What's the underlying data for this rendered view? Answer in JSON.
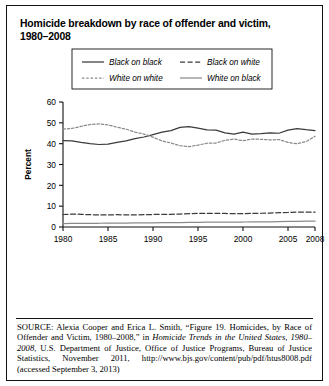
{
  "figure": {
    "title_line1": "Homicide breakdown by race of offender and victim,",
    "title_line2": "1980–2008"
  },
  "source": {
    "label": "SOURCE:",
    "text_part1": " Alexia Cooper and Erica L. Smith, “Figure 19. Homicides, by Race of Offender and Victim, 1980–2008,” in ",
    "italic1": "Homicide Trends in the United States, 1980–2008",
    "text_part2": ", U.S. Department of Justice, Office of Justice Programs, Bureau of Justice Statistics, November 2011, http://www.bjs.gov/content/pub/pdf/htus8008.pdf (accessed September 3, 2013)"
  },
  "chart_data": {
    "type": "line",
    "title": "Homicide breakdown by race of offender and victim, 1980–2008",
    "xlabel": "",
    "ylabel": "Percent",
    "ylim": [
      0,
      60
    ],
    "yticks": [
      0,
      10,
      20,
      30,
      40,
      50,
      60
    ],
    "xlim": [
      1980,
      2008
    ],
    "xticks": [
      1980,
      1985,
      1990,
      1995,
      2000,
      2005,
      2008
    ],
    "xtick_labels": [
      "1980",
      "1985",
      "1990",
      "1995",
      "2000",
      "2005",
      "2008"
    ],
    "grid": false,
    "legend_position": "top-center",
    "x": [
      1980,
      1981,
      1982,
      1983,
      1984,
      1985,
      1986,
      1987,
      1988,
      1989,
      1990,
      1991,
      1992,
      1993,
      1994,
      1995,
      1996,
      1997,
      1998,
      1999,
      2000,
      2001,
      2002,
      2003,
      2004,
      2005,
      2006,
      2007,
      2008
    ],
    "series": [
      {
        "name": "Black on black",
        "style": "solid",
        "color": "#3b3b3b",
        "values": [
          41.5,
          41.3,
          40.6,
          40.0,
          39.6,
          39.8,
          40.6,
          41.3,
          42.4,
          43.2,
          44.3,
          45.5,
          46.3,
          47.8,
          48.2,
          47.5,
          46.6,
          46.5,
          45.2,
          44.6,
          45.5,
          44.6,
          44.8,
          45.2,
          45.0,
          46.5,
          47.2,
          46.7,
          46.3
        ]
      },
      {
        "name": "Black on white",
        "style": "dashed",
        "color": "#3b3b3b",
        "values": [
          6.0,
          6.2,
          6.1,
          5.9,
          5.8,
          5.8,
          5.9,
          5.8,
          5.8,
          5.9,
          6.0,
          6.1,
          6.1,
          6.2,
          6.4,
          6.5,
          6.5,
          6.6,
          6.5,
          6.4,
          6.4,
          6.5,
          6.6,
          6.7,
          6.9,
          7.0,
          7.2,
          7.2,
          7.1
        ]
      },
      {
        "name": "White on white",
        "style": "fine-dashed",
        "color": "#8a8a8a",
        "values": [
          47.0,
          47.3,
          48.3,
          49.2,
          49.5,
          49.0,
          47.9,
          47.0,
          45.5,
          44.6,
          43.1,
          41.3,
          40.3,
          39.0,
          38.6,
          39.3,
          40.2,
          40.3,
          41.6,
          42.2,
          41.4,
          42.2,
          42.1,
          41.8,
          42.0,
          40.6,
          40.0,
          41.0,
          43.5
        ]
      },
      {
        "name": "White on black",
        "style": "solid",
        "color": "#8a8a8a",
        "values": [
          1.6,
          1.7,
          1.7,
          1.8,
          1.8,
          1.9,
          1.9,
          1.9,
          2.0,
          2.0,
          2.0,
          2.1,
          2.1,
          2.1,
          2.2,
          2.2,
          2.3,
          2.3,
          2.3,
          2.4,
          2.4,
          2.5,
          2.5,
          2.5,
          2.6,
          2.7,
          2.7,
          2.8,
          2.8
        ]
      }
    ],
    "legend": [
      {
        "name": "Black on black",
        "style": "solid",
        "color": "#3b3b3b"
      },
      {
        "name": "Black on white",
        "style": "dashed",
        "color": "#3b3b3b"
      },
      {
        "name": "White on white",
        "style": "fine-dashed",
        "color": "#8a8a8a"
      },
      {
        "name": "White on black",
        "style": "solid",
        "color": "#8a8a8a"
      }
    ]
  }
}
